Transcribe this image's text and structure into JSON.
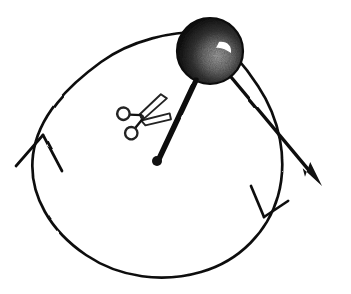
{
  "figure": {
    "kind": "hand-drawn-physics-diagram",
    "background_color": "#ffffff",
    "ink_color": "#111111",
    "width": 351,
    "height": 294
  },
  "canvas": {
    "width": 351,
    "height": 294
  },
  "orbit": {
    "name": "circular-path",
    "center_x": 157,
    "center_y": 161,
    "radius_x": 125,
    "radius_y": 120,
    "stroke_width": 2.6,
    "rotation_direction": "clockwise",
    "style": "hand-drawn ink circle"
  },
  "direction_arrows": [
    {
      "name": "direction-arrowhead-left",
      "position_x": 40,
      "position_y": 145,
      "points": "up",
      "style": "open chevron",
      "stroke_width": 2.6
    },
    {
      "name": "direction-arrowhead-lower-right",
      "position_x": 258,
      "position_y": 205,
      "points": "down-left",
      "style": "open chevron",
      "stroke_width": 2.6
    }
  ],
  "ball": {
    "name": "ball",
    "center_x": 210,
    "center_y": 51,
    "radius": 33,
    "body_color": "#1a1a1a",
    "shading_color": "#8a8a8a",
    "highlight_color": "#ffffff",
    "description": "solid dark sphere with stippled grey crescent and white highlight"
  },
  "string": {
    "name": "string-radius",
    "from_x": 196,
    "from_y": 80,
    "to_x": 158,
    "to_y": 161,
    "stroke_width": 5.5,
    "description": "thick line from ball to centre pivot"
  },
  "pivot": {
    "name": "center-pivot-dot",
    "x": 157,
    "y": 161,
    "radius": 5
  },
  "velocity_arrow": {
    "name": "tangential-velocity-arrow",
    "from_x": 226,
    "from_y": 71,
    "to_x": 322,
    "to_y": 186,
    "stroke_width": 3.4,
    "head_length": 26,
    "head_width": 15,
    "description": "straight tangent arrow with solid filled arrowhead pointing down-right"
  },
  "scissors": {
    "name": "scissors",
    "center_x": 142,
    "center_y": 117,
    "rotation_deg": -22,
    "stroke_width": 1.8,
    "handle_color": "#ffffff",
    "outline_color": "#222222",
    "description": "open scissors with two ring handles at left and blades pointing upper-right, poised to cut the string"
  }
}
